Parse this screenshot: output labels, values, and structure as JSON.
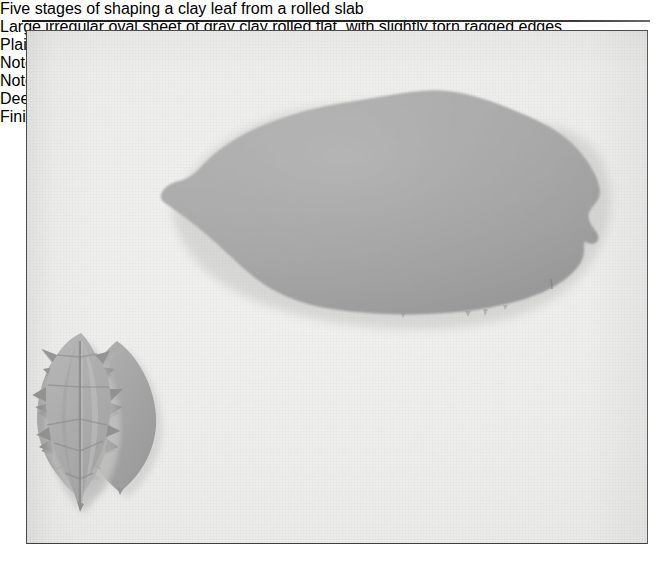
{
  "page": {
    "background_color": "#ffffff",
    "width": 665,
    "height": 566
  },
  "rule": {
    "name": "horizontal-rule",
    "color": "#1d1d1d"
  },
  "photo": {
    "title": "Five stages of shaping a clay leaf from a rolled slab",
    "frame_border_color": "#4c4c4c",
    "surface_color": "#eeeeed",
    "clay_color": "#a9a9a9",
    "clay_shadow_color": "#8a8a8a",
    "clay_highlight_color": "#c3c3c3",
    "objects": [
      {
        "id": "slab",
        "name": "rolled-clay-slab",
        "label": "Rolled out clay slab",
        "description": "Large irregular oval sheet of gray clay rolled flat, with slightly torn ragged edges"
      },
      {
        "id": "step-1",
        "name": "leaf-step-1",
        "label": "Step 1",
        "description": "Plain pointed oval blank cut from the slab, no notches"
      },
      {
        "id": "step-2",
        "name": "leaf-step-2",
        "label": "Step 2",
        "description": "Notches cut along one side only, left side still smooth"
      },
      {
        "id": "step-3",
        "name": "leaf-step-3",
        "label": "Step 3",
        "description": "Notches cut along both sides, shallow serrations"
      },
      {
        "id": "step-4",
        "name": "leaf-step-4",
        "label": "Step 4",
        "description": "Deeper notches with lobes pinched and textured"
      },
      {
        "id": "step-5",
        "name": "leaf-step-5",
        "label": "Step 5",
        "description": "Finished leaf with sharp serrations and a central vein pressed down the middle"
      }
    ]
  }
}
